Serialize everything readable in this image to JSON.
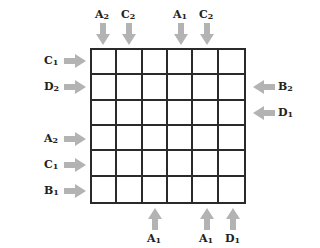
{
  "puzzle": {
    "rows": 6,
    "cols": 6,
    "arrow_color": "#b3b3b3",
    "grid_color": "#2a2a2a",
    "top_clues": [
      {
        "col": 1,
        "letter": "A",
        "number": "2"
      },
      {
        "col": 2,
        "letter": "C",
        "number": "2"
      },
      {
        "col": 4,
        "letter": "A",
        "number": "1"
      },
      {
        "col": 5,
        "letter": "C",
        "number": "2"
      }
    ],
    "left_clues": [
      {
        "row": 1,
        "letter": "C",
        "number": "1"
      },
      {
        "row": 2,
        "letter": "D",
        "number": "2"
      },
      {
        "row": 4,
        "letter": "A",
        "number": "2"
      },
      {
        "row": 5,
        "letter": "C",
        "number": "1"
      },
      {
        "row": 6,
        "letter": "B",
        "number": "1"
      }
    ],
    "right_clues": [
      {
        "row": 2,
        "letter": "B",
        "number": "2"
      },
      {
        "row": 3,
        "letter": "D",
        "number": "1"
      }
    ],
    "bottom_clues": [
      {
        "col": 3,
        "letter": "A",
        "number": "1"
      },
      {
        "col": 5,
        "letter": "A",
        "number": "1"
      },
      {
        "col": 6,
        "letter": "D",
        "number": "1"
      }
    ]
  }
}
